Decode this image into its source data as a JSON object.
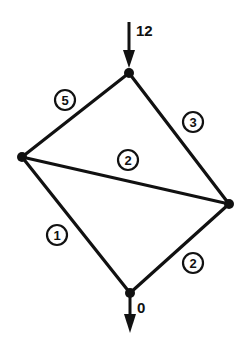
{
  "diagram": {
    "type": "flow-network",
    "nodes": [
      {
        "id": "top",
        "x": 129,
        "y": 73
      },
      {
        "id": "left",
        "x": 22,
        "y": 157
      },
      {
        "id": "right",
        "x": 229,
        "y": 204
      },
      {
        "id": "bottom",
        "x": 130,
        "y": 293
      }
    ],
    "edges": [
      {
        "from": "top",
        "to": "left",
        "label": "5",
        "label_x": 65,
        "label_y": 100
      },
      {
        "from": "top",
        "to": "right",
        "label": "3",
        "label_x": 193,
        "label_y": 122
      },
      {
        "from": "left",
        "to": "right",
        "label": "2",
        "label_x": 128,
        "label_y": 160
      },
      {
        "from": "left",
        "to": "bottom",
        "label": "1",
        "label_x": 57,
        "label_y": 235
      },
      {
        "from": "right",
        "to": "bottom",
        "label": "2",
        "label_x": 193,
        "label_y": 263
      }
    ],
    "source": {
      "label": "12",
      "node": "top"
    },
    "sink": {
      "label": "0",
      "node": "bottom"
    }
  }
}
